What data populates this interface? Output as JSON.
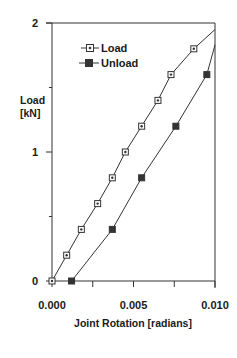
{
  "chart_data": {
    "type": "line",
    "title": "",
    "xlabel": "Joint Rotation [radians]",
    "ylabel": "Load [kN]",
    "ylabel_lines": [
      "Load",
      "[kN]"
    ],
    "xlim": [
      0.0,
      0.01
    ],
    "ylim": [
      0,
      2
    ],
    "x_ticks": [
      0.0,
      0.0025,
      0.005,
      0.0075,
      0.01
    ],
    "x_tick_labels": [
      {
        "value": 0.0,
        "label": "0.000"
      },
      {
        "value": 0.005,
        "label": "0.005"
      },
      {
        "value": 0.01,
        "label": "0.010"
      }
    ],
    "y_ticks": [
      0,
      0.5,
      1,
      1.5,
      2
    ],
    "y_tick_labels": [
      {
        "value": 0,
        "label": "0"
      },
      {
        "value": 1,
        "label": "1"
      },
      {
        "value": 2,
        "label": "2"
      }
    ],
    "grid": false,
    "legend_position": "upper-left-inside",
    "series": [
      {
        "name": "Load",
        "marker": "open-square-dot",
        "x": [
          0.0,
          0.0009,
          0.0018,
          0.0028,
          0.0037,
          0.0045,
          0.0055,
          0.0065,
          0.0073,
          0.0087,
          0.01
        ],
        "y": [
          0.0,
          0.2,
          0.4,
          0.6,
          0.8,
          1.0,
          1.2,
          1.4,
          1.6,
          1.8,
          1.95
        ]
      },
      {
        "name": "Unload",
        "marker": "filled-square",
        "x": [
          0.0012,
          0.0037,
          0.0055,
          0.0076,
          0.0095,
          0.01
        ],
        "y": [
          0.0,
          0.4,
          0.8,
          1.2,
          1.6,
          1.83
        ]
      }
    ]
  },
  "legend": {
    "items": [
      {
        "label": "Load"
      },
      {
        "label": "Unload"
      }
    ]
  },
  "colors": {
    "ink": "#1a1a1a",
    "line": "#333333",
    "background": "#ffffff"
  }
}
